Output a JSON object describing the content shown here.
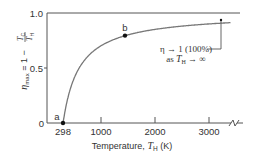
{
  "chart_data": {
    "type": "line",
    "title": "",
    "xlabel": "Temperature, T_H (K)",
    "ylabel": "η_max = 1 − T_C/T_H",
    "xlim": [
      0,
      3500
    ],
    "ylim": [
      0,
      1.0
    ],
    "grid": false,
    "legend": null,
    "x_ticks": [
      298,
      1000,
      2000,
      3000
    ],
    "x_tick_labels": [
      "298",
      "1000",
      "2000",
      "3000"
    ],
    "y_ticks": [
      0,
      0.5,
      1.0
    ],
    "y_tick_labels": [
      "0",
      "0.5",
      "1.0"
    ],
    "series": [
      {
        "name": "η_max",
        "formula": "1 - 298/T_H",
        "x": [
          298,
          350,
          400,
          500,
          600,
          800,
          1000,
          1200,
          1450,
          1800,
          2200,
          2600,
          3000,
          3400
        ],
        "values": [
          0.0,
          0.149,
          0.255,
          0.404,
          0.503,
          0.628,
          0.702,
          0.752,
          0.794,
          0.834,
          0.865,
          0.885,
          0.901,
          0.912
        ]
      }
    ],
    "reference_lines": [
      {
        "y": 1.0,
        "label": "asymptote η = 1"
      }
    ],
    "points": [
      {
        "label": "a",
        "x": 298,
        "y": 0.0
      },
      {
        "label": "b",
        "x": 1450,
        "y": 0.79
      }
    ],
    "annotations": [
      {
        "text_line1": "η → 1 (100%)",
        "text_line2": "as T_H → ∞",
        "target_x": 3200,
        "target_y": 0.91
      }
    ],
    "axis_break": {
      "axis": "x",
      "position": 3400
    }
  },
  "labels": {
    "y_axis": {
      "eta": "η",
      "sub_max": "max",
      "eq": " = 1 − ",
      "frac_num": "T",
      "frac_num_sub": "C",
      "frac_den": "T",
      "frac_den_sub": "H"
    },
    "x_axis": {
      "prefix": "Temperature, ",
      "var": "T",
      "var_sub": "H",
      "unit": " (K)"
    },
    "y_ticks": [
      "1.0",
      "0.5",
      "0"
    ],
    "x_ticks": [
      "298",
      "1000",
      "2000",
      "3000"
    ],
    "point_a": "a",
    "point_b": "b",
    "annotation": {
      "line1": "η → 1 (100%)",
      "line2_prefix": "as ",
      "line2_var": "T",
      "line2_sub": "H",
      "line2_suffix": " → ∞"
    }
  },
  "colors": {
    "axis": "#555555",
    "curve": "#777777",
    "point": "#111111",
    "text": "#333333"
  }
}
